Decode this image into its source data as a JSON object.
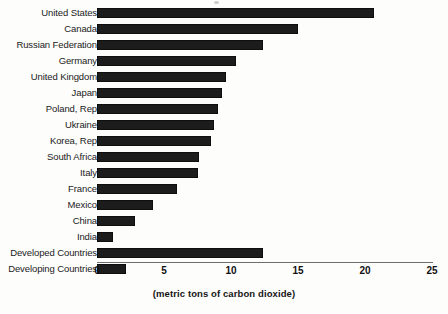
{
  "chart_data": {
    "type": "bar",
    "orientation": "horizontal",
    "title": "",
    "xlabel": "(metric tons of carbon dioxide)",
    "ylabel": "",
    "xlim": [
      0,
      25
    ],
    "xticks": [
      0,
      5,
      10,
      15,
      20,
      25
    ],
    "xtick_labels": [
      "0",
      "5",
      "10",
      "15",
      "20",
      "25"
    ],
    "grid": false,
    "legend": false,
    "bar_color": "#1c1c1c",
    "categories": [
      "United States",
      "Canada",
      "Russian Federation",
      "Germany",
      "United Kingdom",
      "Japan",
      "Poland, Rep",
      "Ukraine",
      "Korea, Rep",
      "South Africa",
      "Italy",
      "France",
      "Mexico",
      "China",
      "India",
      "Developed Countries",
      "Developing Countries"
    ],
    "values": [
      20.7,
      15.0,
      12.4,
      10.4,
      9.6,
      9.3,
      9.0,
      8.7,
      8.5,
      7.6,
      7.5,
      6.0,
      4.2,
      2.8,
      1.2,
      12.4,
      2.2
    ]
  }
}
